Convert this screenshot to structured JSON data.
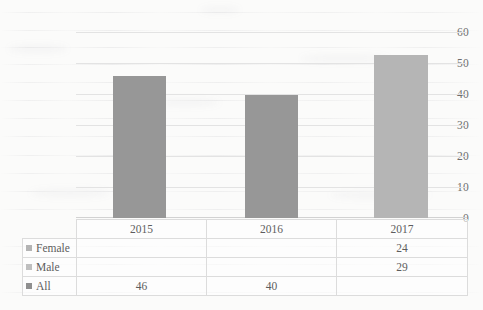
{
  "chart_data": {
    "type": "bar",
    "title": "",
    "subtitle": "",
    "xlabel": "",
    "ylabel": "",
    "categories": [
      "2015",
      "2016",
      "2017"
    ],
    "ylim": [
      0,
      60
    ],
    "ytick_labels": [
      "0",
      "10",
      "20",
      "30",
      "40",
      "50",
      "60"
    ],
    "ytick_values": [
      0,
      10,
      20,
      30,
      40,
      50,
      60
    ],
    "grid": true,
    "legend_position": "data-table-left",
    "series": [
      {
        "name": "Female",
        "values": [
          null,
          null,
          24
        ],
        "display_values": [
          "",
          "",
          "24"
        ],
        "color": "#b0b0b0",
        "marker_color": "#b4b4b4"
      },
      {
        "name": "Male",
        "values": [
          null,
          null,
          29
        ],
        "display_values": [
          "",
          "",
          "29"
        ],
        "color": "#b8b8b8",
        "marker_color": "#bfbfbf"
      },
      {
        "name": "All",
        "values": [
          46,
          40,
          null
        ],
        "display_values": [
          "46",
          "40",
          ""
        ],
        "color": "#979797",
        "marker_color": "#8f8f8f"
      }
    ],
    "bars": [
      {
        "category": "2015",
        "value": 46,
        "color": "#979797"
      },
      {
        "category": "2016",
        "value": 40,
        "color": "#979797"
      },
      {
        "category": "2017",
        "value": 53,
        "color": "#b5b5b5"
      }
    ]
  },
  "table": {
    "legend_header": "",
    "column_headers": [
      "2015",
      "2016",
      "2017"
    ],
    "rows": [
      {
        "label": "Female",
        "marker_color": "#b4b4b4",
        "cells": [
          "",
          "",
          "24"
        ]
      },
      {
        "label": "Male",
        "marker_color": "#bfbfbf",
        "cells": [
          "",
          "",
          "29"
        ]
      },
      {
        "label": "All",
        "marker_color": "#8f8f8f",
        "cells": [
          "46",
          "40",
          ""
        ]
      }
    ]
  },
  "colors": {
    "bar_dark": "#979797",
    "bar_light": "#b5b5b5",
    "gridline": "#e3e3e3",
    "axis": "#d2d2d2",
    "table_border": "#dcdcdc",
    "text": "#5d5d5d",
    "background": "#fbfbfa"
  }
}
